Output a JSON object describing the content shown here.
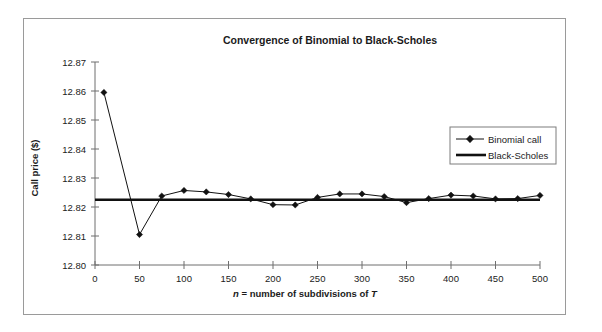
{
  "figure": {
    "border_color": "#9a9a9a",
    "background": "#ffffff"
  },
  "chart_data": {
    "type": "line",
    "title": "Convergence of Binomial to Black-Scholes",
    "xlabel_parts": {
      "italic_n": "n",
      "middle": " = number of subdivisions of ",
      "italic_t": "T"
    },
    "xlabel": "n = number of subdivisions of T",
    "ylabel": "Call price ($)",
    "xlim": [
      0,
      500
    ],
    "ylim": [
      12.8,
      12.87
    ],
    "xticks": [
      0,
      50,
      100,
      150,
      200,
      250,
      300,
      350,
      400,
      450,
      500
    ],
    "xtick_labels": [
      "0",
      "50",
      "100",
      "150",
      "200",
      "250",
      "300",
      "350",
      "400",
      "450",
      "500"
    ],
    "yticks": [
      12.8,
      12.81,
      12.82,
      12.83,
      12.84,
      12.85,
      12.86,
      12.87
    ],
    "ytick_labels": [
      "12.80",
      "12.81",
      "12.82",
      "12.83",
      "12.84",
      "12.85",
      "12.86",
      "12.87"
    ],
    "grid": false,
    "legend_position": "upper right",
    "series": [
      {
        "name": "Binomial call",
        "marker": "diamond",
        "color": "#111111",
        "x": [
          10,
          50,
          75,
          100,
          125,
          150,
          175,
          200,
          225,
          250,
          275,
          300,
          325,
          350,
          375,
          400,
          425,
          450,
          475,
          500
        ],
        "values": [
          12.8595,
          12.8105,
          12.8238,
          12.8257,
          12.8252,
          12.8243,
          12.8228,
          12.8208,
          12.8207,
          12.8233,
          12.8245,
          12.8245,
          12.8236,
          12.8215,
          12.8229,
          12.8241,
          12.8238,
          12.8228,
          12.8229,
          12.824
        ]
      },
      {
        "name": "Black-Scholes",
        "marker": "none",
        "color": "#111111",
        "constant_value": 12.8225,
        "x": [
          0,
          500
        ],
        "values": [
          12.8225,
          12.8225
        ]
      }
    ]
  },
  "legend": {
    "entries": [
      {
        "label": "Binomial call",
        "style": "line-marker"
      },
      {
        "label": "Black-Scholes",
        "style": "thick-line"
      }
    ]
  }
}
